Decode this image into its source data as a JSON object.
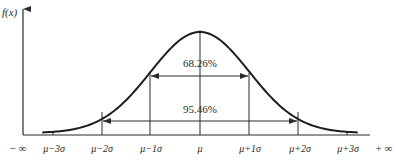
{
  "chart_data": {
    "type": "line",
    "ylabel": "f(x)",
    "xlabel": "",
    "x_ticks": [
      "μ−3σ",
      "μ−2σ",
      "μ−1σ",
      "μ",
      "μ+1σ",
      "μ+2σ",
      "μ+3σ"
    ],
    "x_tick_offsets_sigma": [
      -3,
      -2,
      -1,
      0,
      1,
      2,
      3
    ],
    "x_axis_ends": {
      "left": "− ∞",
      "right": "+ ∞"
    },
    "series": [
      {
        "name": "f(x)",
        "shape": "gaussian",
        "mean": 0,
        "sd": 1,
        "x_range_sigma": [
          -3.2,
          3.2
        ]
      }
    ],
    "annotations": [
      {
        "label": "68.26%",
        "from_sigma": -1,
        "to_sigma": 1,
        "type": "double-arrow"
      },
      {
        "label": "95.46%",
        "from_sigma": -2,
        "to_sigma": 2,
        "type": "double-arrow"
      }
    ],
    "vertical_lines_sigma": [
      -2,
      -1,
      0,
      1,
      2
    ],
    "grid": false,
    "legend": "none"
  },
  "labels": {
    "y_axis": "f(x)",
    "neg_inf": "− ∞",
    "pos_inf": "+ ∞",
    "ticks": [
      "μ−3σ",
      "μ−2σ",
      "μ−1σ",
      "μ",
      "μ+1σ",
      "μ+2σ",
      "μ+3σ"
    ],
    "pct_1sigma": "68.26%",
    "pct_2sigma": "95.46%"
  },
  "colors": {
    "line": "#2a2a2a",
    "curve": "#1e1e1e",
    "background": "#ffffff"
  }
}
